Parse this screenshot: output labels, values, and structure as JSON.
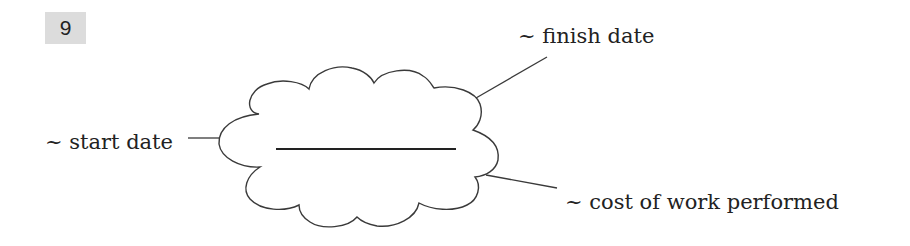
{
  "exercise": {
    "number": "9"
  },
  "diagram": {
    "center_blank": "",
    "labels": {
      "finish": "~ finish date",
      "start": "~ start date",
      "cost": "~ cost of work performed"
    },
    "colors": {
      "stroke": "#3a3a3a",
      "badge_bg": "#dcdcdc"
    }
  }
}
